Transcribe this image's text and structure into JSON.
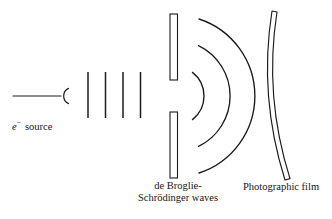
{
  "figure": {
    "type": "physics-diagram",
    "width": 332,
    "height": 219,
    "background_color": "#ffffff",
    "stroke_color": "#1a1a1a"
  },
  "source": {
    "label_symbol": "e",
    "label_superscript": "−",
    "label_word": "source",
    "beam_line": {
      "x1": 13,
      "y1": 96,
      "x2": 61,
      "y2": 96
    },
    "emitter_arc": {
      "cx": 68,
      "cy": 96,
      "radius": 8,
      "opening": "right"
    }
  },
  "plane_waves": {
    "count": 4,
    "x_positions": [
      88,
      105.5,
      123,
      140.5
    ],
    "y_top": 72,
    "y_bottom": 118
  },
  "barrier": {
    "x_left": 170,
    "x_right": 178,
    "upper": {
      "y_top": 14,
      "y_bottom": 80
    },
    "lower": {
      "y_top": 112,
      "y_bottom": 178
    },
    "slit": {
      "y_top": 80,
      "y_bottom": 112,
      "center_x": 174,
      "center_y": 96
    },
    "fill": "#ffffff"
  },
  "diffracted_waves": {
    "center_x": 174,
    "center_y": 96,
    "arc_radii": [
      30,
      56,
      81
    ],
    "arc_half_angles_deg": [
      52,
      64,
      72
    ],
    "caption_line1": "de Broglie-",
    "caption_line2": "Schrödinger waves"
  },
  "photographic_film": {
    "caption": "Photographic film",
    "front_arc": {
      "x1": 272,
      "y1": 11,
      "cx": 258,
      "cy": 96,
      "x2": 285,
      "y2": 180
    },
    "thickness": 5
  },
  "colors": {
    "ink": "#1a1a1a",
    "paper": "#ffffff"
  }
}
